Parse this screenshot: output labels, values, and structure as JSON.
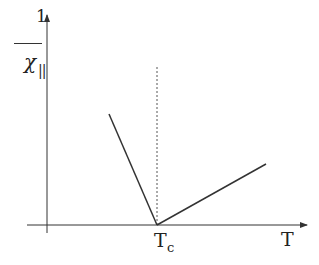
{
  "diagram": {
    "type": "susceptibility-vs-temperature",
    "y_axis_label": {
      "numerator": "1",
      "denominator": "χ",
      "subscript": "||"
    },
    "x_axis_label": "T",
    "critical_point": {
      "label": "T",
      "subscript": "c"
    },
    "lines": [
      {
        "name": "below-tc",
        "from": [
          109,
          114
        ],
        "to": [
          157,
          225
        ]
      },
      {
        "name": "above-tc",
        "from": [
          157,
          225
        ],
        "to": [
          266,
          164
        ]
      }
    ],
    "dashed_line": {
      "x": 157,
      "y_top": 67,
      "y_bottom": 225
    },
    "colors": {
      "axis": "#333333",
      "curve": "#333333",
      "dashed": "#555555"
    }
  }
}
